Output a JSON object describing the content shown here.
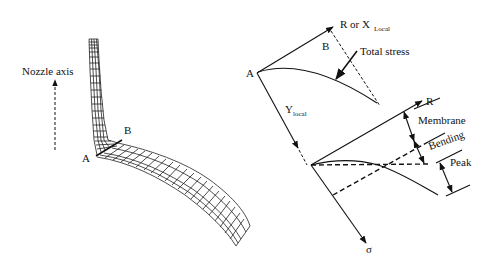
{
  "left_panel": {
    "title": "Nozzle-to-shell finite element mesh",
    "nozzle_axis_label": "Nozzle axis",
    "point_a_label": "A",
    "point_b_label": "B"
  },
  "right_panel": {
    "top_diagram": {
      "x_axis_label": "R or X",
      "x_axis_subscript": "Local",
      "y_axis_label": "Y",
      "y_axis_subscript": "local",
      "point_a_label": "A",
      "point_b_label": "B",
      "curve_label": "Total stress"
    },
    "bottom_diagram": {
      "r_axis_label": "R",
      "sigma_axis_label": "σ",
      "components": [
        "Membrane",
        "Bending",
        "Peak"
      ]
    }
  },
  "colors": {
    "line": "#111111",
    "background": "#ffffff"
  }
}
